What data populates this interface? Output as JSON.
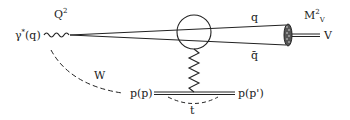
{
  "diagram": {
    "type": "feynman-diagram",
    "labels": {
      "photon": "γ",
      "photon_star": "*",
      "photon_momentum": "(q)",
      "virtuality": "Q",
      "virtuality_power": "2",
      "quark": "q",
      "antiquark": "q̄",
      "meson_mass": "M",
      "meson_mass_power": "2",
      "meson_mass_sub": "V",
      "meson": "V",
      "energy": "W",
      "proton_in": "p(p)",
      "proton_out": "p(p')",
      "momentum_transfer": "t"
    },
    "colors": {
      "line": "#222222",
      "background": "#ffffff"
    }
  }
}
